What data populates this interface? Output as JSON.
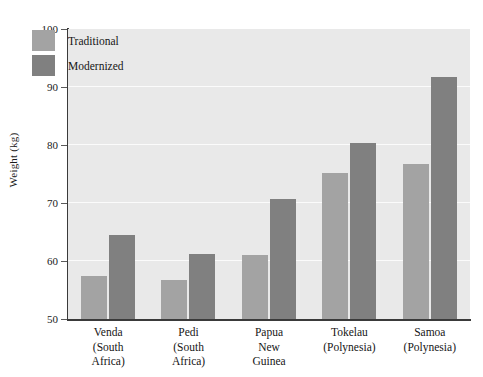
{
  "chart_data": {
    "type": "bar",
    "title": "",
    "xlabel": "",
    "ylabel": "Weight (kg)",
    "ylim": [
      50,
      100
    ],
    "yticks": [
      50,
      60,
      70,
      80,
      90,
      100
    ],
    "ytick_labels": [
      "50",
      "60",
      "70",
      "80",
      "90",
      "100"
    ],
    "gridlines": [
      60,
      70,
      80,
      90
    ],
    "grid": true,
    "legend_position": "top-left",
    "categories": [
      [
        "Venda",
        "(South",
        "Africa)"
      ],
      [
        "Pedi",
        "(South",
        "Africa)"
      ],
      [
        "Papua",
        "New",
        "Guinea"
      ],
      [
        "Tokelau",
        "(Polynesia)"
      ],
      [
        "Samoa",
        "(Polynesia)"
      ]
    ],
    "category_names": [
      "Venda (South Africa)",
      "Pedi (South Africa)",
      "Papua New Guinea",
      "Tokelau (Polynesia)",
      "Samoa (Polynesia)"
    ],
    "series": [
      {
        "name": "Traditional",
        "color": "#a3a3a3",
        "values": [
          57.5,
          56.8,
          61.0,
          75.1,
          76.8
        ]
      },
      {
        "name": "Modernized",
        "color": "#808080",
        "values": [
          64.4,
          61.2,
          70.7,
          80.3,
          91.8
        ]
      }
    ]
  },
  "style": {
    "plot_background": "#e9e9e9",
    "gridline_color": "#fbfbfb",
    "axis_color": "#3a3a3a",
    "text_color": "#161616"
  }
}
